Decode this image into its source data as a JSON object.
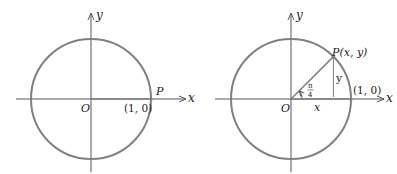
{
  "colors": {
    "circle": "#808080",
    "axis": "#555555",
    "text": "#222222"
  },
  "left_diagram": {
    "origin_label": "O",
    "x_axis_label": "x",
    "y_axis_label": "y",
    "point_label": "P",
    "point_coord_label": "(1, 0)"
  },
  "right_diagram": {
    "origin_label": "O",
    "x_axis_label": "x",
    "y_axis_label": "y",
    "point_label": "P(x, y)",
    "unit_point_label": "(1, 0)",
    "horizontal_leg_label": "x",
    "vertical_leg_label": "y",
    "angle_numerator": "π",
    "angle_denominator": "4"
  }
}
